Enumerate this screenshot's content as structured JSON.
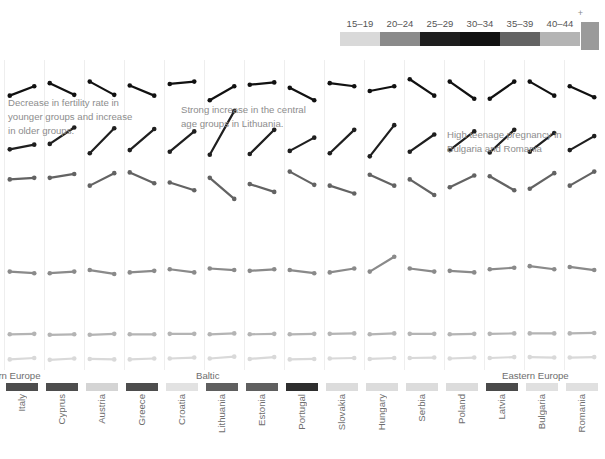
{
  "legend": {
    "name": "age-group-legend",
    "labels": [
      "15–19",
      "20–24",
      "25–29",
      "30–34",
      "35–39",
      "40–44"
    ],
    "colors": [
      "#d9d9d9",
      "#8a8a8a",
      "#1f1f1f",
      "#111111",
      "#636363",
      "#b4b4b4"
    ]
  },
  "annotations": [
    {
      "name": "annotation-decrease",
      "text": "Decrease in fertility rate in\nyounger groups and increase\nin older groups."
    },
    {
      "name": "annotation-lithuania",
      "text": "Strong increase in the central\nage groups in Lithuania."
    },
    {
      "name": "annotation-teenage",
      "text": "High teenage pregnancy in\nBulgaria and Romania"
    }
  ],
  "regions": [
    {
      "label": "Southern Europe",
      "x": -32
    },
    {
      "label": "Baltic",
      "x": 196
    },
    {
      "label": "Eastern Europe",
      "x": 502
    }
  ],
  "colors": {
    "background": "#ffffff",
    "gridline": "#eeeeee",
    "text": "#6e6e6e",
    "annotation": "#8d8d8d"
  },
  "chart_data": {
    "type": "line",
    "subtype": "slope-chart-small-multiples",
    "title": "",
    "xlabel": "",
    "ylabel": "",
    "grid": true,
    "legend_position": "top-right",
    "series_names": [
      "15–19",
      "20–24",
      "25–29",
      "30–34",
      "35–39",
      "40–44"
    ],
    "series_colors": [
      "#d9d9d9",
      "#8a8a8a",
      "#1f1f1f",
      "#111111",
      "#636363",
      "#b4b4b4"
    ],
    "x": [
      "start",
      "end"
    ],
    "bar_color_scale": "grey",
    "countries": [
      {
        "name": "Spain",
        "clipped": true,
        "bar": "#5a5a5a",
        "x": -20,
        "w": 20,
        "slopes": [
          [
            0.57,
            0.55
          ],
          [
            0.53,
            0.47
          ],
          [
            0.41,
            0.31
          ],
          [
            0.37,
            0.36
          ],
          [
            0.36,
            0.33
          ],
          [
            0.12,
            0.11
          ]
        ]
      },
      {
        "name": "Italy",
        "bar": "#4d4d4d",
        "x": 4,
        "w": 36,
        "slopes": [
          [
            0.1,
            0.13
          ],
          [
            0.21,
            0.19
          ],
          [
            0.47,
            0.53
          ],
          [
            0.62,
            0.74
          ],
          [
            0.7,
            0.72
          ],
          [
            0.08,
            0.09
          ]
        ]
      },
      {
        "name": "Cyprus",
        "bar": "#4d4d4d",
        "x": 44,
        "w": 36,
        "slopes": [
          [
            0.09,
            0.12
          ],
          [
            0.19,
            0.21
          ],
          [
            0.54,
            0.75
          ],
          [
            0.78,
            0.63
          ],
          [
            0.72,
            0.77
          ],
          [
            0.07,
            0.08
          ]
        ]
      },
      {
        "name": "Austria",
        "bar": "#d4d4d4",
        "x": 84,
        "w": 36,
        "slopes": [
          [
            0.11,
            0.1
          ],
          [
            0.23,
            0.18
          ],
          [
            0.42,
            0.74
          ],
          [
            0.8,
            0.63
          ],
          [
            0.62,
            0.78
          ],
          [
            0.07,
            0.09
          ]
        ]
      },
      {
        "name": "Greece",
        "bar": "#4d4d4d",
        "x": 124,
        "w": 36,
        "slopes": [
          [
            0.1,
            0.12
          ],
          [
            0.2,
            0.22
          ],
          [
            0.46,
            0.73
          ],
          [
            0.75,
            0.62
          ],
          [
            0.79,
            0.65
          ],
          [
            0.08,
            0.08
          ]
        ]
      },
      {
        "name": "Croatia",
        "bar": "#e2e2e2",
        "x": 164,
        "w": 36,
        "slopes": [
          [
            0.12,
            0.14
          ],
          [
            0.24,
            0.2
          ],
          [
            0.44,
            0.7
          ],
          [
            0.77,
            0.8
          ],
          [
            0.66,
            0.56
          ],
          [
            0.09,
            0.09
          ]
        ]
      },
      {
        "name": "Lithuania",
        "bar": "#5f5f5f",
        "x": 204,
        "w": 36,
        "slopes": [
          [
            0.12,
            0.16
          ],
          [
            0.25,
            0.23
          ],
          [
            0.4,
            0.96
          ],
          [
            0.56,
            0.74
          ],
          [
            0.72,
            0.45
          ],
          [
            0.08,
            0.1
          ]
        ]
      },
      {
        "name": "Estonia",
        "bar": "#5f5f5f",
        "x": 244,
        "w": 36,
        "slopes": [
          [
            0.11,
            0.15
          ],
          [
            0.22,
            0.24
          ],
          [
            0.41,
            0.72
          ],
          [
            0.76,
            0.79
          ],
          [
            0.64,
            0.54
          ],
          [
            0.08,
            0.09
          ]
        ]
      },
      {
        "name": "Portugal",
        "bar": "#2e2e2e",
        "x": 284,
        "w": 36,
        "slopes": [
          [
            0.1,
            0.11
          ],
          [
            0.23,
            0.19
          ],
          [
            0.45,
            0.62
          ],
          [
            0.72,
            0.56
          ],
          [
            0.8,
            0.63
          ],
          [
            0.08,
            0.09
          ]
        ]
      },
      {
        "name": "Slovakia",
        "bar": "#dcdcdc",
        "x": 324,
        "w": 36,
        "slopes": [
          [
            0.12,
            0.13
          ],
          [
            0.2,
            0.25
          ],
          [
            0.42,
            0.72
          ],
          [
            0.78,
            0.74
          ],
          [
            0.62,
            0.52
          ],
          [
            0.09,
            0.1
          ]
        ]
      },
      {
        "name": "Hungary",
        "bar": "#dcdcdc",
        "x": 364,
        "w": 36,
        "slopes": [
          [
            0.11,
            0.13
          ],
          [
            0.21,
            0.4
          ],
          [
            0.38,
            0.78
          ],
          [
            0.68,
            0.74
          ],
          [
            0.76,
            0.62
          ],
          [
            0.08,
            0.1
          ]
        ]
      },
      {
        "name": "Serbia",
        "bar": "#dcdcdc",
        "x": 404,
        "w": 36,
        "slopes": [
          [
            0.13,
            0.14
          ],
          [
            0.25,
            0.21
          ],
          [
            0.44,
            0.66
          ],
          [
            0.83,
            0.62
          ],
          [
            0.7,
            0.5
          ],
          [
            0.09,
            0.09
          ]
        ]
      },
      {
        "name": "Poland",
        "bar": "#dcdcdc",
        "x": 444,
        "w": 36,
        "slopes": [
          [
            0.12,
            0.14
          ],
          [
            0.22,
            0.2
          ],
          [
            0.46,
            0.7
          ],
          [
            0.8,
            0.58
          ],
          [
            0.6,
            0.75
          ],
          [
            0.08,
            0.09
          ]
        ]
      },
      {
        "name": "Latvia",
        "bar": "#4a4a4a",
        "x": 484,
        "w": 36,
        "slopes": [
          [
            0.13,
            0.15
          ],
          [
            0.24,
            0.26
          ],
          [
            0.43,
            0.72
          ],
          [
            0.58,
            0.8
          ],
          [
            0.74,
            0.56
          ],
          [
            0.09,
            0.1
          ]
        ]
      },
      {
        "name": "Bulgaria",
        "bar": "#e0e0e0",
        "x": 524,
        "w": 36,
        "slopes": [
          [
            0.15,
            0.14
          ],
          [
            0.28,
            0.24
          ],
          [
            0.44,
            0.68
          ],
          [
            0.8,
            0.62
          ],
          [
            0.58,
            0.78
          ],
          [
            0.1,
            0.1
          ]
        ]
      },
      {
        "name": "Romania",
        "bar": "#e0e0e0",
        "x": 564,
        "w": 36,
        "slopes": [
          [
            0.14,
            0.15
          ],
          [
            0.27,
            0.23
          ],
          [
            0.46,
            0.64
          ],
          [
            0.74,
            0.6
          ],
          [
            0.62,
            0.8
          ],
          [
            0.1,
            0.11
          ]
        ]
      }
    ]
  }
}
